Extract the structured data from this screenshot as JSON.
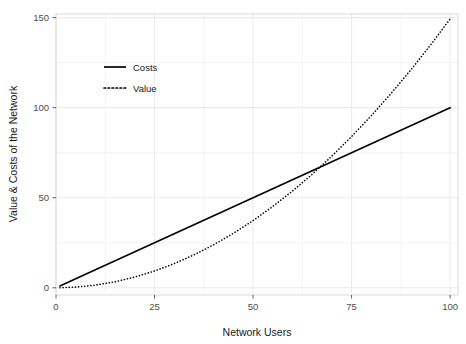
{
  "chart_data": {
    "type": "line",
    "title": "",
    "xlabel": "Network Users",
    "ylabel": "Value & Costs of the Network",
    "xlim": [
      0,
      102
    ],
    "ylim": [
      -4,
      152
    ],
    "xticks": [
      0,
      25,
      50,
      75,
      100
    ],
    "xtick_labels": [
      "0",
      "25",
      "50",
      "75",
      "100"
    ],
    "yticks": [
      0,
      50,
      100,
      150
    ],
    "ytick_labels": [
      "0",
      "50",
      "100",
      "150"
    ],
    "grid": true,
    "grid_color": "#ebebeb",
    "panel_background": "#ffffff",
    "panel_border_color": "#d9d9d9",
    "legend_position": "inside top-left",
    "series": [
      {
        "name": "Costs",
        "linestyle": "solid",
        "color": "#000000",
        "linewidth": 1.6,
        "x": [
          1,
          5,
          10,
          15,
          20,
          25,
          30,
          35,
          40,
          45,
          50,
          55,
          60,
          65,
          70,
          75,
          80,
          85,
          90,
          95,
          100
        ],
        "values": [
          1,
          5,
          10,
          15,
          20,
          25,
          30,
          35,
          40,
          45,
          50,
          55,
          60,
          65,
          70,
          75,
          80,
          85,
          90,
          95,
          100
        ]
      },
      {
        "name": "Value",
        "linestyle": "dotted",
        "color": "#000000",
        "linewidth": 1.6,
        "x": [
          1,
          5,
          10,
          15,
          20,
          25,
          30,
          35,
          40,
          45,
          50,
          55,
          60,
          65,
          70,
          75,
          80,
          85,
          90,
          95,
          100
        ],
        "values": [
          0.01,
          0.37,
          1.49,
          3.36,
          5.97,
          9.33,
          13.43,
          18.28,
          23.88,
          30.22,
          37.31,
          45.15,
          53.73,
          63.06,
          73.13,
          83.96,
          95.52,
          107.84,
          120.9,
          134.7,
          149.25
        ]
      }
    ],
    "annotations": {
      "crossover_x": 66,
      "crossover_y": 66
    }
  },
  "legend": {
    "items": [
      {
        "label": "Costs",
        "style": "solid"
      },
      {
        "label": "Value",
        "style": "dotted"
      }
    ]
  }
}
